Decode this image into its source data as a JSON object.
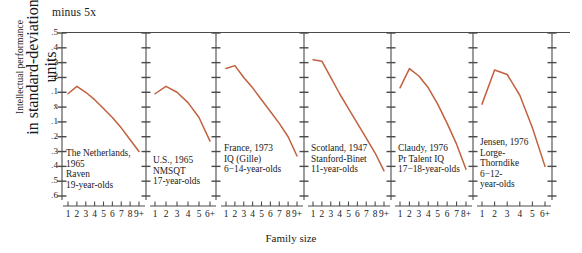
{
  "figure": {
    "top_note": "minus 5x",
    "y_axis_label_line1": "Intellectual performance",
    "y_axis_label_line2": "in standard-deviation units",
    "x_axis_label": "Family size",
    "y_ticks": [
      ".5",
      ".4",
      ".3",
      ".2",
      ".1",
      "x̄",
      ".1",
      ".2",
      ".3",
      ".4",
      ".5",
      ".6"
    ],
    "accent_color": "#c2603f",
    "axis_color": "#4a4a4a"
  },
  "chart_data": {
    "type": "line",
    "title": "minus 5x",
    "xlabel": "Family size",
    "ylabel": "Intellectual performance in standard-deviation units",
    "ylim": [
      -0.6,
      0.5
    ],
    "y_tick_values": [
      0.5,
      0.4,
      0.3,
      0.2,
      0.1,
      0.0,
      -0.1,
      -0.2,
      -0.3,
      -0.4,
      -0.5,
      -0.6
    ],
    "y_tick_labels": [
      ".5",
      ".4",
      ".3",
      ".2",
      ".1",
      "x̄",
      ".1",
      ".2",
      ".3",
      ".4",
      ".5",
      ".6"
    ],
    "grid": false,
    "legend": "none",
    "panels": [
      {
        "index": 1,
        "caption_lines": [
          "The Netherlands,",
          "1965",
          "Raven",
          "19-year-olds"
        ],
        "country": "The Netherlands",
        "year": "1965",
        "test": "Raven",
        "age": "19-year-olds",
        "categories": [
          "1",
          "2",
          "3",
          "4",
          "5",
          "6",
          "7",
          "8",
          "9+"
        ],
        "values": [
          0.09,
          0.14,
          0.1,
          0.05,
          -0.01,
          -0.07,
          -0.14,
          -0.22,
          -0.3
        ]
      },
      {
        "index": 2,
        "caption_lines": [
          "U.S., 1965",
          "NMSQT",
          "17-year-olds"
        ],
        "country": "U.S.",
        "year": "1965",
        "test": "NMSQT",
        "age": "17-year-olds",
        "categories": [
          "1",
          "2",
          "3",
          "4",
          "5",
          "6+"
        ],
        "values": [
          0.09,
          0.14,
          0.1,
          0.03,
          -0.07,
          -0.23
        ]
      },
      {
        "index": 3,
        "caption_lines": [
          "France, 1973",
          "IQ (Gille)",
          "6−14-year-olds"
        ],
        "country": "France",
        "year": "1973",
        "test": "IQ (Gille)",
        "age": "6−14-year-olds",
        "categories": [
          "1",
          "2",
          "3",
          "4",
          "5",
          "6",
          "7",
          "8",
          "9+"
        ],
        "values": [
          0.26,
          0.28,
          0.2,
          0.13,
          0.05,
          -0.03,
          -0.11,
          -0.2,
          -0.33
        ]
      },
      {
        "index": 4,
        "caption_lines": [
          "Scotland, 1947",
          "Stanford-Binet",
          "11-year-olds"
        ],
        "country": "Scotland",
        "year": "1947",
        "test": "Stanford-Binet",
        "age": "11-year-olds",
        "categories": [
          "1",
          "2",
          "3",
          "4",
          "5",
          "6",
          "7",
          "8",
          "9+"
        ],
        "values": [
          0.32,
          0.31,
          0.2,
          0.09,
          -0.01,
          -0.11,
          -0.21,
          -0.31,
          -0.43
        ]
      },
      {
        "index": 5,
        "caption_lines": [
          "Claudy, 1976",
          "Pr Talent IQ",
          "17−18-year-olds"
        ],
        "country": "U.S. (Claudy)",
        "year": "1976",
        "test": "Pr Talent IQ",
        "age": "17−18-year-olds",
        "categories": [
          "1",
          "2",
          "3",
          "4",
          "5",
          "6",
          "7",
          "8+"
        ],
        "values": [
          0.13,
          0.26,
          0.21,
          0.13,
          0.02,
          -0.11,
          -0.25,
          -0.42
        ]
      },
      {
        "index": 6,
        "caption_lines": [
          "Jensen, 1976",
          "Lorge-",
          "Thorndike",
          "6−12-",
          "year-olds"
        ],
        "country": "U.S. (Jensen)",
        "year": "1976",
        "test": "Lorge-Thorndike",
        "age": "6−12-year-olds",
        "categories": [
          "1",
          "2",
          "3",
          "4",
          "5",
          "6+"
        ],
        "values": [
          0.02,
          0.25,
          0.22,
          0.08,
          -0.14,
          -0.4
        ]
      }
    ]
  }
}
